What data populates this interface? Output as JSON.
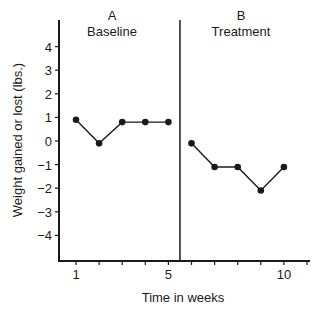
{
  "chart_data": {
    "type": "line",
    "title": "",
    "xlabel": "Time in weeks",
    "ylabel": "Weight gained or lost (lbs.)",
    "xlim": [
      0.3,
      11.2
    ],
    "ylim": [
      -5,
      5.5
    ],
    "x_tick_labels": [
      "1",
      "5",
      "10"
    ],
    "x_ticks": [
      1,
      2,
      3,
      4,
      5,
      6,
      7,
      8,
      9,
      10,
      11
    ],
    "y_tick_labels": [
      "4",
      "3",
      "2",
      "1",
      "0",
      "−1",
      "−2",
      "−3",
      "−4"
    ],
    "y_ticks": [
      4,
      3,
      2,
      1,
      0,
      -1,
      -2,
      -3,
      -4
    ],
    "grid": false,
    "legend": null,
    "phase_divider_x": 5.5,
    "phases": [
      {
        "letter": "A",
        "label": "Baseline"
      },
      {
        "letter": "B",
        "label": "Treatment"
      }
    ],
    "series": [
      {
        "name": "A Baseline",
        "x": [
          1,
          2,
          3,
          4,
          5
        ],
        "values": [
          0.9,
          -0.1,
          0.8,
          0.8,
          0.8
        ]
      },
      {
        "name": "B Treatment",
        "x": [
          6,
          7,
          8,
          9,
          10
        ],
        "values": [
          -0.1,
          -1.1,
          -1.1,
          -2.1,
          -1.1
        ]
      }
    ]
  }
}
